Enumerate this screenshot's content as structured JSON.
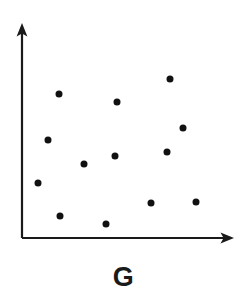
{
  "figure": {
    "label": "G",
    "background_color": "#ffffff",
    "ink_color": "#1a1a1a",
    "point_color": "#111111"
  },
  "chart_data": {
    "type": "scatter",
    "title": "G",
    "xlabel": "",
    "ylabel": "",
    "grid": false,
    "legend": false,
    "axis_style": "arrow-terminated",
    "xlim": [
      0,
      100
    ],
    "ylim": [
      0,
      100
    ],
    "tick_labels": {
      "x": [],
      "y": []
    },
    "point_count": 13,
    "marker": "filled-circle",
    "marker_size_px": 7,
    "points": [
      {
        "x": 17,
        "y": 67
      },
      {
        "x": 80,
        "y": 75
      },
      {
        "x": 47,
        "y": 63
      },
      {
        "x": 12,
        "y": 46
      },
      {
        "x": 76,
        "y": 51
      },
      {
        "x": 45,
        "y": 38
      },
      {
        "x": 69,
        "y": 40
      },
      {
        "x": 29,
        "y": 35
      },
      {
        "x": 8,
        "y": 26
      },
      {
        "x": 61,
        "y": 17
      },
      {
        "x": 82,
        "y": 17
      },
      {
        "x": 18,
        "y": 10
      },
      {
        "x": 40,
        "y": 7
      }
    ],
    "points_px": [
      {
        "cx": 59,
        "cy": 94
      },
      {
        "cx": 170,
        "cy": 79
      },
      {
        "cx": 117,
        "cy": 102
      },
      {
        "cx": 48,
        "cy": 140
      },
      {
        "cx": 183,
        "cy": 128
      },
      {
        "cx": 115,
        "cy": 156
      },
      {
        "cx": 167,
        "cy": 152
      },
      {
        "cx": 84,
        "cy": 164
      },
      {
        "cx": 38,
        "cy": 183
      },
      {
        "cx": 151,
        "cy": 203
      },
      {
        "cx": 196,
        "cy": 202
      },
      {
        "cx": 60,
        "cy": 216
      },
      {
        "cx": 106,
        "cy": 224
      }
    ],
    "axes_px": {
      "origin": {
        "x": 22,
        "y": 238
      },
      "y_axis_top": {
        "x": 22,
        "y": 24
      },
      "x_axis_right": {
        "x": 233,
        "y": 238
      }
    }
  }
}
